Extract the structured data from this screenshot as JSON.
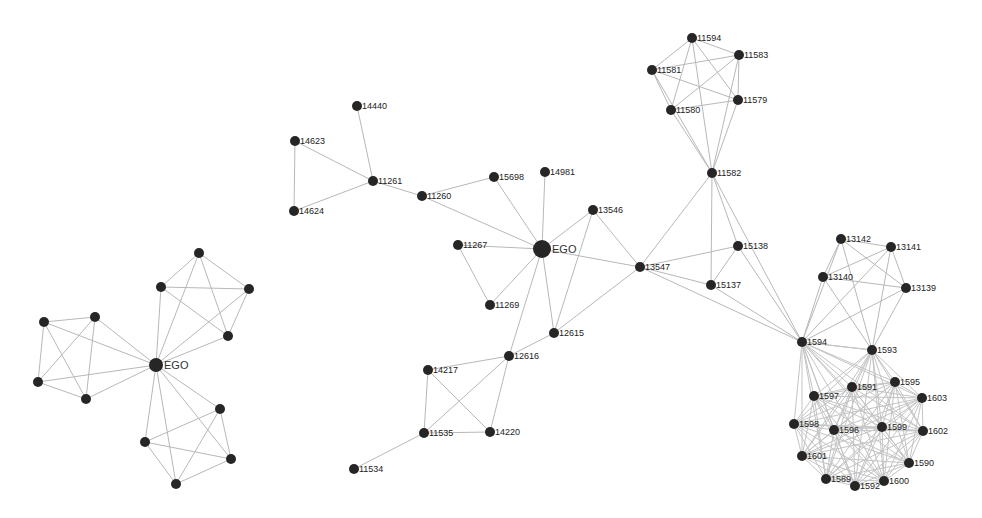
{
  "figure": {
    "left_panel": {
      "title": "Simple ego network",
      "ego": {
        "id": "EGO",
        "label": "EGO",
        "x": 156,
        "y": 365,
        "r": 7
      },
      "nodes": [
        {
          "id": "a1",
          "label": "",
          "x": 199,
          "y": 253
        },
        {
          "id": "a2",
          "label": "",
          "x": 161,
          "y": 287
        },
        {
          "id": "a3",
          "label": "",
          "x": 249,
          "y": 289
        },
        {
          "id": "a4",
          "label": "",
          "x": 228,
          "y": 336
        },
        {
          "id": "b1",
          "label": "",
          "x": 44,
          "y": 322
        },
        {
          "id": "b2",
          "label": "",
          "x": 95,
          "y": 317
        },
        {
          "id": "b3",
          "label": "",
          "x": 38,
          "y": 382
        },
        {
          "id": "b4",
          "label": "",
          "x": 86,
          "y": 399
        },
        {
          "id": "c1",
          "label": "",
          "x": 220,
          "y": 409
        },
        {
          "id": "c2",
          "label": "",
          "x": 145,
          "y": 442
        },
        {
          "id": "c3",
          "label": "",
          "x": 231,
          "y": 459
        },
        {
          "id": "c4",
          "label": "",
          "x": 176,
          "y": 484
        }
      ],
      "edges": [
        [
          "EGO",
          "a1"
        ],
        [
          "EGO",
          "a2"
        ],
        [
          "EGO",
          "a3"
        ],
        [
          "EGO",
          "a4"
        ],
        [
          "EGO",
          "b1"
        ],
        [
          "EGO",
          "b2"
        ],
        [
          "EGO",
          "b3"
        ],
        [
          "EGO",
          "b4"
        ],
        [
          "EGO",
          "c1"
        ],
        [
          "EGO",
          "c2"
        ],
        [
          "EGO",
          "c3"
        ],
        [
          "EGO",
          "c4"
        ],
        [
          "a1",
          "a2"
        ],
        [
          "a1",
          "a3"
        ],
        [
          "a1",
          "a4"
        ],
        [
          "a2",
          "a3"
        ],
        [
          "a2",
          "a4"
        ],
        [
          "a3",
          "a4"
        ],
        [
          "b1",
          "b2"
        ],
        [
          "b1",
          "b3"
        ],
        [
          "b1",
          "b4"
        ],
        [
          "b2",
          "b3"
        ],
        [
          "b2",
          "b4"
        ],
        [
          "b3",
          "b4"
        ],
        [
          "c1",
          "c2"
        ],
        [
          "c1",
          "c3"
        ],
        [
          "c1",
          "c4"
        ],
        [
          "c2",
          "c3"
        ],
        [
          "c2",
          "c4"
        ],
        [
          "c3",
          "c4"
        ]
      ]
    },
    "right_panel": {
      "title": "Labeled ego network",
      "ego": {
        "id": "EGO",
        "label": "EGO",
        "x": 542,
        "y": 249,
        "r": 9
      },
      "nodes": [
        {
          "id": "14440",
          "label": "14440",
          "x": 357,
          "y": 106
        },
        {
          "id": "14623",
          "label": "14623",
          "x": 295,
          "y": 141
        },
        {
          "id": "14624",
          "label": "14624",
          "x": 294,
          "y": 211
        },
        {
          "id": "11261",
          "label": "11261",
          "x": 373,
          "y": 181
        },
        {
          "id": "11260",
          "label": "11260",
          "x": 422,
          "y": 196
        },
        {
          "id": "15698",
          "label": "15698",
          "x": 494,
          "y": 177
        },
        {
          "id": "14981",
          "label": "14981",
          "x": 545,
          "y": 172
        },
        {
          "id": "13546",
          "label": "13546",
          "x": 593,
          "y": 210
        },
        {
          "id": "11267",
          "label": "11267",
          "x": 458,
          "y": 245
        },
        {
          "id": "11269",
          "label": "11269",
          "x": 490,
          "y": 305
        },
        {
          "id": "12615",
          "label": "12615",
          "x": 554,
          "y": 333
        },
        {
          "id": "13547",
          "label": "13547",
          "x": 640,
          "y": 267
        },
        {
          "id": "12616",
          "label": "12616",
          "x": 509,
          "y": 356
        },
        {
          "id": "14217",
          "label": "14217",
          "x": 428,
          "y": 370
        },
        {
          "id": "11535",
          "label": "11535",
          "x": 424,
          "y": 433
        },
        {
          "id": "14220",
          "label": "14220",
          "x": 490,
          "y": 432
        },
        {
          "id": "11534",
          "label": "11534",
          "x": 354,
          "y": 469
        },
        {
          "id": "11594",
          "label": "11594",
          "x": 692,
          "y": 38
        },
        {
          "id": "11583",
          "label": "11583",
          "x": 739,
          "y": 55
        },
        {
          "id": "11581",
          "label": "11581",
          "x": 652,
          "y": 70
        },
        {
          "id": "11579",
          "label": "11579",
          "x": 738,
          "y": 100
        },
        {
          "id": "11580",
          "label": "11580",
          "x": 671,
          "y": 110
        },
        {
          "id": "11582",
          "label": "11582",
          "x": 712,
          "y": 173
        },
        {
          "id": "15138",
          "label": "15138",
          "x": 738,
          "y": 246
        },
        {
          "id": "15137",
          "label": "15137",
          "x": 711,
          "y": 285
        },
        {
          "id": "13142",
          "label": "13142",
          "x": 841,
          "y": 239
        },
        {
          "id": "13141",
          "label": "13141",
          "x": 891,
          "y": 247
        },
        {
          "id": "13140",
          "label": "13140",
          "x": 823,
          "y": 277
        },
        {
          "id": "13139",
          "label": "13139",
          "x": 906,
          "y": 288
        },
        {
          "id": "1594",
          "label": "1594",
          "x": 802,
          "y": 342
        },
        {
          "id": "1593",
          "label": "1593",
          "x": 872,
          "y": 350
        },
        {
          "id": "1597",
          "label": "1597",
          "x": 814,
          "y": 396
        },
        {
          "id": "1591",
          "label": "1591",
          "x": 852,
          "y": 387
        },
        {
          "id": "1595",
          "label": "1595",
          "x": 895,
          "y": 382
        },
        {
          "id": "1603",
          "label": "1603",
          "x": 922,
          "y": 398
        },
        {
          "id": "1598",
          "label": "1598",
          "x": 794,
          "y": 424
        },
        {
          "id": "1596",
          "label": "1596",
          "x": 834,
          "y": 430
        },
        {
          "id": "1599",
          "label": "1599",
          "x": 882,
          "y": 427
        },
        {
          "id": "1602",
          "label": "1602",
          "x": 923,
          "y": 431
        },
        {
          "id": "1601",
          "label": "1601",
          "x": 802,
          "y": 456
        },
        {
          "id": "1590",
          "label": "1590",
          "x": 909,
          "y": 463
        },
        {
          "id": "1589",
          "label": "1589",
          "x": 826,
          "y": 479
        },
        {
          "id": "1592",
          "label": "1592",
          "x": 855,
          "y": 486
        },
        {
          "id": "1600",
          "label": "1600",
          "x": 884,
          "y": 481
        }
      ],
      "edges": [
        [
          "14440",
          "11261"
        ],
        [
          "14623",
          "11261"
        ],
        [
          "14624",
          "11261"
        ],
        [
          "14623",
          "14624"
        ],
        [
          "11261",
          "11260"
        ],
        [
          "11260",
          "EGO"
        ],
        [
          "11260",
          "15698"
        ],
        [
          "15698",
          "EGO"
        ],
        [
          "14981",
          "EGO"
        ],
        [
          "13546",
          "EGO"
        ],
        [
          "11267",
          "EGO"
        ],
        [
          "11269",
          "EGO"
        ],
        [
          "11267",
          "11269"
        ],
        [
          "EGO",
          "12615"
        ],
        [
          "EGO",
          "13547"
        ],
        [
          "EGO",
          "12616"
        ],
        [
          "13546",
          "13547"
        ],
        [
          "13546",
          "12615"
        ],
        [
          "12615",
          "12616"
        ],
        [
          "12615",
          "13547"
        ],
        [
          "12616",
          "14217"
        ],
        [
          "12616",
          "11535"
        ],
        [
          "12616",
          "14220"
        ],
        [
          "14217",
          "11535"
        ],
        [
          "14217",
          "14220"
        ],
        [
          "11535",
          "14220"
        ],
        [
          "11535",
          "11534"
        ],
        [
          "13547",
          "11582"
        ],
        [
          "13547",
          "15138"
        ],
        [
          "13547",
          "15137"
        ],
        [
          "13547",
          "1594"
        ],
        [
          "11582",
          "15138"
        ],
        [
          "11582",
          "15137"
        ],
        [
          "11582",
          "1594"
        ],
        [
          "15138",
          "15137"
        ],
        [
          "15138",
          "1594"
        ],
        [
          "15137",
          "1594"
        ],
        [
          "11594",
          "11583"
        ],
        [
          "11594",
          "11581"
        ],
        [
          "11594",
          "11579"
        ],
        [
          "11594",
          "11580"
        ],
        [
          "11594",
          "11582"
        ],
        [
          "11583",
          "11581"
        ],
        [
          "11583",
          "11579"
        ],
        [
          "11583",
          "11580"
        ],
        [
          "11583",
          "11582"
        ],
        [
          "11581",
          "11579"
        ],
        [
          "11581",
          "11580"
        ],
        [
          "11581",
          "11582"
        ],
        [
          "11579",
          "11580"
        ],
        [
          "11579",
          "11582"
        ],
        [
          "11580",
          "11582"
        ],
        [
          "13142",
          "13141"
        ],
        [
          "13142",
          "13140"
        ],
        [
          "13142",
          "13139"
        ],
        [
          "13142",
          "1594"
        ],
        [
          "13142",
          "1593"
        ],
        [
          "13141",
          "13140"
        ],
        [
          "13141",
          "13139"
        ],
        [
          "13141",
          "1594"
        ],
        [
          "13141",
          "1593"
        ],
        [
          "13140",
          "13139"
        ],
        [
          "13140",
          "1594"
        ],
        [
          "13140",
          "1593"
        ],
        [
          "13139",
          "1594"
        ],
        [
          "13139",
          "1593"
        ],
        [
          "1594",
          "1593"
        ]
      ],
      "dense_cluster": {
        "members": [
          "1594",
          "1593",
          "1597",
          "1591",
          "1595",
          "1603",
          "1598",
          "1596",
          "1599",
          "1602",
          "1601",
          "1590",
          "1589",
          "1592",
          "1600"
        ],
        "fully_connected": true
      }
    }
  }
}
